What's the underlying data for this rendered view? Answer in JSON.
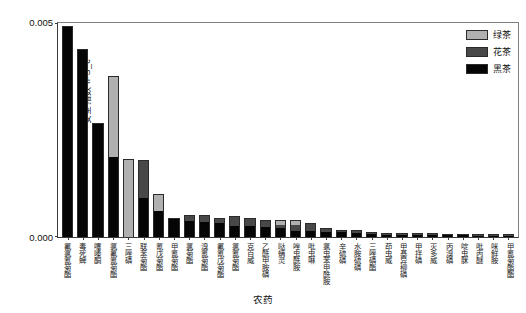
{
  "chart_data": {
    "type": "bar",
    "stacked": true,
    "title": "",
    "xlabel": "农药",
    "ylabel": "安全指数 IFS_c",
    "ylim": [
      0.0,
      0.005
    ],
    "ytick_labels": [
      "0.000",
      "0.005"
    ],
    "grid": false,
    "legend_position": "top-right",
    "legend": [
      {
        "name": "绿茶",
        "color": "#b0b0b0"
      },
      {
        "name": "花茶",
        "color": "#484848"
      },
      {
        "name": "黑茶",
        "color": "#050505"
      }
    ],
    "categories": [
      "氟氯氰菊酯",
      "毒死蜱",
      "噻嗪酮",
      "氯氟氰菊酯",
      "三唑磷",
      "联苯菊酯",
      "氰戊菊酯",
      "甲氰菊酯",
      "氯菊酯",
      "溴氰菊酯",
      "氟氰戊菊酯",
      "氯氰菊酯",
      "克百威",
      "乙酰甲胺磷",
      "哒螨灵",
      "唑虫酰胺",
      "吡虫啉",
      "氯虫苯甲酰胺",
      "辛硫磷",
      "水胺硫磷",
      "三唑磷酯",
      "茚虫威",
      "甲基异柳磷",
      "甲拌磷",
      "灭多威",
      "丙溴磷",
      "啶虫脒",
      "吡丙醚",
      "咪鲜胺",
      "甲氰菊酯酯"
    ],
    "series": [
      {
        "name": "黑茶",
        "values": [
          0.00485,
          0.00432,
          0.00262,
          0.00185,
          0.0,
          0.0009,
          0.0006,
          0.00042,
          0.00038,
          0.00035,
          0.00033,
          0.00026,
          0.00026,
          0.00024,
          0.0002,
          0.00015,
          0.00013,
          0.00012,
          0.00011,
          0.0001,
          6e-05,
          5e-05,
          5e-05,
          4e-05,
          4e-05,
          4e-05,
          4e-05,
          3e-05,
          3e-05,
          3e-05
        ]
      },
      {
        "name": "花茶",
        "values": [
          0.0,
          0.0,
          0.0,
          0.0,
          0.0,
          0.00085,
          0.0,
          0.0,
          0.0001,
          0.00013,
          9e-05,
          0.0002,
          0.00016,
          0.00014,
          7e-05,
          0.00013,
          0.00018,
          6e-05,
          4e-05,
          3e-05,
          3e-05,
          2e-05,
          2e-05,
          2e-05,
          2e-05,
          1e-05,
          1e-05,
          1e-05,
          1e-05,
          1e-05
        ]
      },
      {
        "name": "绿茶",
        "values": [
          0.0,
          0.0,
          0.0,
          0.00185,
          0.00178,
          0.0,
          0.00038,
          0.0,
          0.0,
          0.0,
          0.0,
          0.0,
          0.0,
          0.0,
          0.0001,
          0.0001,
          0.0,
          0.0,
          0.0,
          0.0,
          0.0,
          0.0,
          0.0,
          0.0,
          0.0,
          0.0,
          0.0,
          0.0,
          0.0,
          0.0
        ]
      }
    ]
  }
}
